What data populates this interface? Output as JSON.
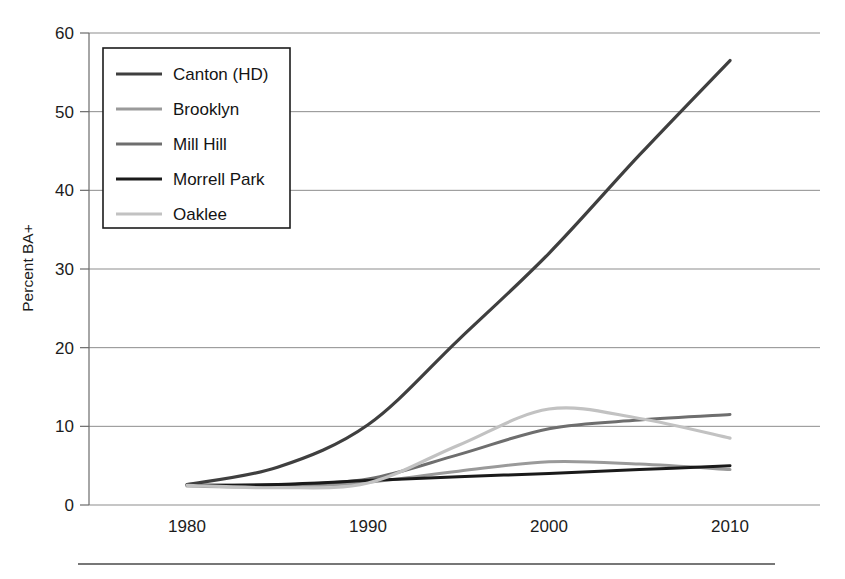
{
  "chart_data": {
    "type": "line",
    "title": "",
    "xlabel": "",
    "ylabel": "Percent BA+",
    "xlim": [
      1976,
      2014
    ],
    "ylim": [
      0,
      60
    ],
    "xticks": [
      "1980",
      "1990",
      "2000",
      "2010"
    ],
    "xtick_values": [
      1980,
      1990,
      2000,
      2010
    ],
    "yticks": [
      "0",
      "10",
      "20",
      "30",
      "40",
      "50",
      "60"
    ],
    "ytick_values": [
      0,
      10,
      20,
      30,
      40,
      50,
      60
    ],
    "grid": true,
    "legend_position": "upper-left",
    "x": [
      1980,
      1985,
      1990,
      1995,
      2000,
      2005,
      2010
    ],
    "series": [
      {
        "name": "Canton (HD)",
        "color": "#3f3f3f",
        "width": 3.2,
        "values": [
          2.6,
          4.8,
          10.2,
          21.0,
          32.0,
          44.5,
          56.5
        ]
      },
      {
        "name": "Brooklyn",
        "color": "#9a9a9a",
        "width": 3.0,
        "values": [
          2.4,
          2.3,
          2.9,
          4.3,
          5.5,
          5.2,
          4.5
        ]
      },
      {
        "name": "Mill Hill",
        "color": "#6e6e6e",
        "width": 3.0,
        "values": [
          2.5,
          2.6,
          3.3,
          6.4,
          9.7,
          10.8,
          11.5
        ]
      },
      {
        "name": "Morrell Park",
        "color": "#1a1a1a",
        "width": 3.0,
        "values": [
          2.5,
          2.6,
          3.1,
          3.6,
          4.0,
          4.5,
          5.0
        ]
      },
      {
        "name": "Oaklee",
        "color": "#c2c2c2",
        "width": 3.2,
        "values": [
          2.5,
          2.2,
          2.8,
          7.6,
          12.2,
          11.0,
          8.5
        ]
      }
    ]
  },
  "axes": {
    "ylabel": "Percent BA+"
  },
  "legend": {
    "items": [
      {
        "label": "Canton (HD)"
      },
      {
        "label": "Brooklyn"
      },
      {
        "label": "Mill Hill"
      },
      {
        "label": "Morrell Park"
      },
      {
        "label": "Oaklee"
      }
    ]
  }
}
